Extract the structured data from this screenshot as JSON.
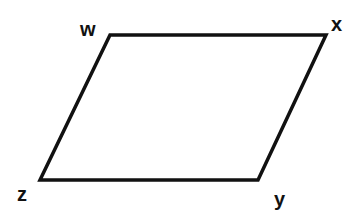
{
  "diagram": {
    "type": "parallelogram",
    "stroke_color": "#111111",
    "stroke_width": 3.5,
    "vertices": [
      {
        "label": "w",
        "x": 110,
        "y": 35,
        "label_x": 80,
        "label_y": 36
      },
      {
        "label": "x",
        "x": 326,
        "y": 35,
        "label_x": 331,
        "label_y": 31
      },
      {
        "label": "y",
        "x": 258,
        "y": 180,
        "label_x": 274,
        "label_y": 206
      },
      {
        "label": "z",
        "x": 40,
        "y": 180,
        "label_x": 17,
        "label_y": 201
      }
    ]
  }
}
